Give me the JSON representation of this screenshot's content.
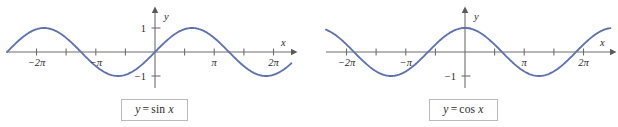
{
  "figure": {
    "background": "#ffffff",
    "curve_color": "#5f72b0",
    "axis_color": "#6e6e6e",
    "label_color": "#2b2b2b",
    "caption_border_color": "#b9b9b9"
  },
  "panels": [
    {
      "id": "sin",
      "caption": {
        "lhs": "y",
        "operator": "=",
        "fn": "sin",
        "arg": "x",
        "full_text": "y = sin x"
      },
      "axes": {
        "x_axis_label": "x",
        "y_axis_label": "y",
        "x_tick_labels": [
          "−2π",
          "−π",
          "π",
          "2π"
        ],
        "y_tick_labels": [
          "1",
          "−1"
        ]
      }
    },
    {
      "id": "cos",
      "caption": {
        "lhs": "y",
        "operator": "=",
        "fn": "cos",
        "arg": "x",
        "full_text": "y = cos x"
      },
      "axes": {
        "x_axis_label": "x",
        "y_axis_label": "y",
        "x_tick_labels": [
          "−2π",
          "−π",
          "π",
          "2π"
        ],
        "y_tick_labels": [
          "−1"
        ]
      }
    }
  ],
  "chart_data": [
    {
      "type": "line",
      "id": "sin",
      "title": "y = sin x",
      "function": "sin",
      "xlabel": "x",
      "ylabel": "y",
      "xlim": [
        -7.33,
        7.33
      ],
      "ylim": [
        -1.45,
        1.45
      ],
      "grid": false,
      "legend": "none",
      "amplitude": 1,
      "period": 6.283185307,
      "x_ticks": [
        -6.283185307,
        -4.71238898,
        -3.141592654,
        -1.570796327,
        1.570796327,
        3.141592654,
        4.71238898,
        6.283185307
      ],
      "x_tick_labels": [
        "−2π",
        "",
        "−π",
        "",
        "",
        "π",
        "",
        "2π"
      ],
      "y_ticks": [
        -1,
        1
      ],
      "y_tick_labels": [
        "−1",
        "1"
      ],
      "x": [
        -7.33,
        -6.807,
        -6.283,
        -5.76,
        -5.236,
        -4.712,
        -4.189,
        -3.665,
        -3.142,
        -2.618,
        -2.094,
        -1.571,
        -1.047,
        -0.524,
        0,
        0.524,
        1.047,
        1.571,
        2.094,
        2.618,
        3.142,
        3.665,
        4.189,
        4.712,
        5.236,
        5.76,
        6.283,
        6.807,
        7.33
      ],
      "y": [
        -0.5,
        -0.5,
        0,
        0.5,
        0.866,
        1,
        0.866,
        0.5,
        0,
        -0.5,
        -0.866,
        -1,
        -0.866,
        -0.5,
        0,
        0.5,
        0.866,
        1,
        0.866,
        0.5,
        0,
        -0.5,
        -0.866,
        -1,
        -0.866,
        -0.5,
        0,
        0.5,
        0.866
      ],
      "annotations": [
        "y = sin x"
      ]
    },
    {
      "type": "line",
      "id": "cos",
      "title": "y = cos x",
      "function": "cos",
      "xlabel": "x",
      "ylabel": "y",
      "xlim": [
        -7.33,
        7.33
      ],
      "ylim": [
        -1.45,
        1.45
      ],
      "grid": false,
      "legend": "none",
      "amplitude": 1,
      "period": 6.283185307,
      "x_ticks": [
        -6.283185307,
        -4.71238898,
        -3.141592654,
        -1.570796327,
        1.570796327,
        3.141592654,
        4.71238898,
        6.283185307
      ],
      "x_tick_labels": [
        "−2π",
        "",
        "−π",
        "",
        "",
        "π",
        "",
        "2π"
      ],
      "y_ticks": [
        -1,
        1
      ],
      "y_tick_labels": [
        "−1",
        ""
      ],
      "x": [
        -7.33,
        -6.807,
        -6.283,
        -5.76,
        -5.236,
        -4.712,
        -4.189,
        -3.665,
        -3.142,
        -2.618,
        -2.094,
        -1.571,
        -1.047,
        -0.524,
        0,
        0.524,
        1.047,
        1.571,
        2.094,
        2.618,
        3.142,
        3.665,
        4.189,
        4.712,
        5.236,
        5.76,
        6.283,
        6.807,
        7.33
      ],
      "y": [
        0.866,
        0.866,
        1,
        0.866,
        0.5,
        0,
        -0.5,
        -0.866,
        -1,
        -0.866,
        -0.5,
        0,
        0.5,
        0.866,
        1,
        0.866,
        0.5,
        0,
        -0.5,
        -0.866,
        -1,
        -0.866,
        -0.5,
        0,
        0.5,
        0.866,
        1,
        0.866,
        0.5
      ],
      "annotations": [
        "y = cos x"
      ]
    }
  ]
}
